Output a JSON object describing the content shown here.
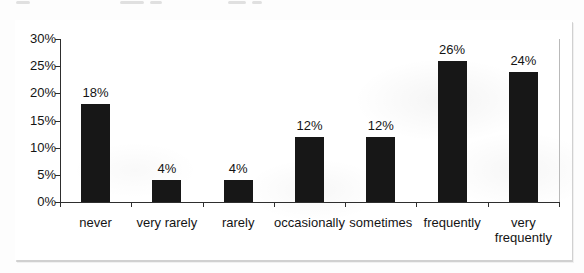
{
  "chart_data": {
    "type": "bar",
    "title": "",
    "xlabel": "",
    "ylabel": "",
    "categories": [
      "never",
      "very rarely",
      "rarely",
      "occasionally",
      "sometimes",
      "frequently",
      "very frequently"
    ],
    "category_labels_display": [
      "never",
      "very rarely",
      "rarely",
      "occasionally",
      "sometimes",
      "frequently",
      "very\nfrequently"
    ],
    "values": [
      18,
      4,
      4,
      12,
      12,
      26,
      24
    ],
    "data_labels": [
      "18%",
      "4%",
      "4%",
      "12%",
      "12%",
      "26%",
      "24%"
    ],
    "ylim": [
      0,
      30
    ],
    "ytick_step": 5,
    "ytick_labels": [
      "0%",
      "5%",
      "10%",
      "15%",
      "20%",
      "25%",
      "30%"
    ],
    "grid": false,
    "legend": null,
    "colors": {
      "bar": "#171717",
      "axis": "#2e2e2e",
      "tick": "#2e2e2e",
      "text": "#141414",
      "frame_border": "#a3a3a3",
      "plot_right_border": "#b9b9b9",
      "background": "#ffffff"
    }
  }
}
